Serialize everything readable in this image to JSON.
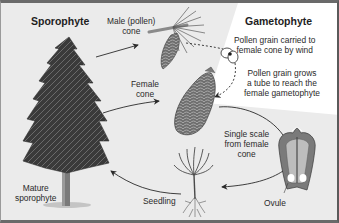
{
  "diagram": {
    "type": "life-cycle",
    "colors": {
      "background": "#ebebeb",
      "gametophyte_region": "#ffffff",
      "border": "#6a6a6a",
      "arrow": "#2a2a2a",
      "text": "#2a2a2a"
    },
    "sections": {
      "sporophyte_title": "Sporophyte",
      "gametophyte_title": "Gametophyte"
    },
    "stages": [
      {
        "id": "male-cone",
        "label_line1": "Male (pollen)",
        "label_line2": "cone"
      },
      {
        "id": "female-cone",
        "label_line1": "Female",
        "label_line2": "cone"
      },
      {
        "id": "single-scale",
        "label_line1": "Single scale",
        "label_line2": "from female",
        "label_line3": "cone"
      },
      {
        "id": "ovule",
        "label_line1": "Ovule"
      },
      {
        "id": "seedling",
        "label_line1": "Seedling"
      },
      {
        "id": "mature-sporophyte",
        "label_line1": "Mature",
        "label_line2": "sporophyte"
      }
    ],
    "annotations": [
      {
        "id": "pollen-wind",
        "line1": "Pollen grain carried to",
        "line2": "female cone by wind"
      },
      {
        "id": "pollen-tube",
        "line1": "Pollen grain grows",
        "line2": "a tube to reach the",
        "line3": "female gametophyte"
      }
    ],
    "arrows": [
      {
        "from": "mature-sporophyte",
        "to": "male-cone",
        "style": "solid"
      },
      {
        "from": "mature-sporophyte",
        "to": "female-cone",
        "style": "solid"
      },
      {
        "from": "male-cone",
        "to": "female-cone",
        "style": "dashed",
        "via": "pollen grain"
      },
      {
        "from": "female-cone",
        "to": "single-scale",
        "style": "solid"
      },
      {
        "from": "single-scale",
        "to": "seedling",
        "style": "solid"
      },
      {
        "from": "seedling",
        "to": "mature-sporophyte",
        "style": "solid"
      }
    ]
  }
}
